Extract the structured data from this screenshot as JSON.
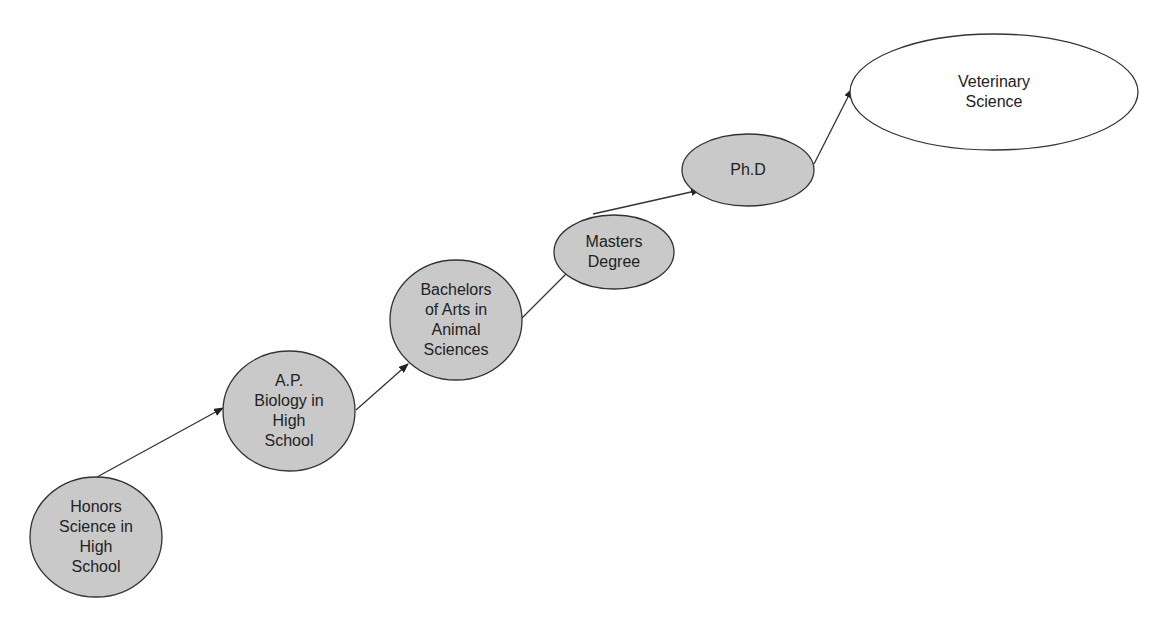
{
  "diagram": {
    "type": "flow",
    "colors": {
      "filled_node": "#c9c9c9",
      "target_node": "#ffffff",
      "stroke": "#333333"
    },
    "nodes": [
      {
        "id": "honors",
        "label": "Honors\nScience in\nHigh\nSchool",
        "cx": 96,
        "cy": 537,
        "rx": 66,
        "ry": 60,
        "filled": true
      },
      {
        "id": "ap",
        "label": "A.P.\nBiology in\nHigh\nSchool",
        "cx": 289,
        "cy": 411,
        "rx": 66,
        "ry": 60,
        "filled": true
      },
      {
        "id": "bachelors",
        "label": "Bachelors\nof Arts in\nAnimal\nSciences",
        "cx": 456,
        "cy": 320,
        "rx": 66,
        "ry": 60,
        "filled": true
      },
      {
        "id": "masters",
        "label": "Masters\nDegree",
        "cx": 614,
        "cy": 252,
        "rx": 60,
        "ry": 37,
        "filled": true
      },
      {
        "id": "phd",
        "label": "Ph.D",
        "cx": 748,
        "cy": 170,
        "rx": 66,
        "ry": 36,
        "filled": true
      },
      {
        "id": "vet",
        "label": "Veterinary\nScience",
        "cx": 994,
        "cy": 92,
        "rx": 144,
        "ry": 58,
        "filled": false
      }
    ],
    "edges": [
      {
        "from": "honors",
        "to": "ap",
        "x1": 97,
        "y1": 477,
        "x2": 223,
        "y2": 408
      },
      {
        "from": "ap",
        "to": "bachelors",
        "x1": 356,
        "y1": 410,
        "x2": 408,
        "y2": 364
      },
      {
        "from": "bachelors",
        "to": "masters",
        "x1": 522,
        "y1": 318,
        "x2": 575,
        "y2": 265
      },
      {
        "from": "masters",
        "to": "phd",
        "x1": 593,
        "y1": 214,
        "x2": 700,
        "y2": 190
      },
      {
        "from": "phd",
        "to": "vet",
        "x1": 814,
        "y1": 164,
        "x2": 852,
        "y2": 89
      }
    ]
  }
}
